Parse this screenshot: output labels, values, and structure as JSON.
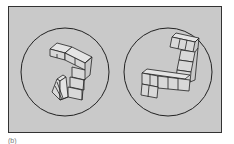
{
  "figure": {
    "type": "mental-rotation-stimulus",
    "panels": [
      {
        "id": "left",
        "shape": "cube-block-figure",
        "orientation": "rotated"
      },
      {
        "id": "right",
        "shape": "cube-block-figure",
        "orientation": "upright"
      }
    ],
    "caption": "(b)",
    "colors": {
      "background": "#c9c9c9",
      "stroke": "#222222",
      "cube_fill": "#e6e6e6"
    }
  }
}
